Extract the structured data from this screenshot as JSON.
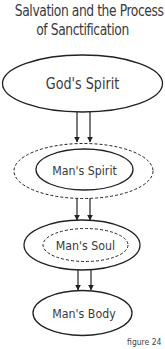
{
  "title": {
    "line1": "Salvation and the Process",
    "line2": "of Sanctification"
  },
  "nodes": [
    {
      "id": "gods-spirit",
      "label": "God's Spirit",
      "style": "solid"
    },
    {
      "id": "mans-spirit",
      "label": "Man's Spirit",
      "style": "solid-inside-dashed"
    },
    {
      "id": "mans-soul",
      "label": "Man's Soul",
      "style": "dashed-inside-solid"
    },
    {
      "id": "mans-body",
      "label": "Man's Body",
      "style": "solid"
    }
  ],
  "edges": [
    {
      "from": "gods-spirit",
      "to": "mans-spirit",
      "arrows": 2
    },
    {
      "from": "mans-spirit",
      "to": "mans-soul",
      "arrows": 2
    },
    {
      "from": "mans-soul",
      "to": "mans-body",
      "arrows": 2
    }
  ],
  "caption": "figure 24",
  "colors": {
    "stroke": "#222222",
    "text": "#3a3a3a",
    "background": "#ffffff"
  }
}
